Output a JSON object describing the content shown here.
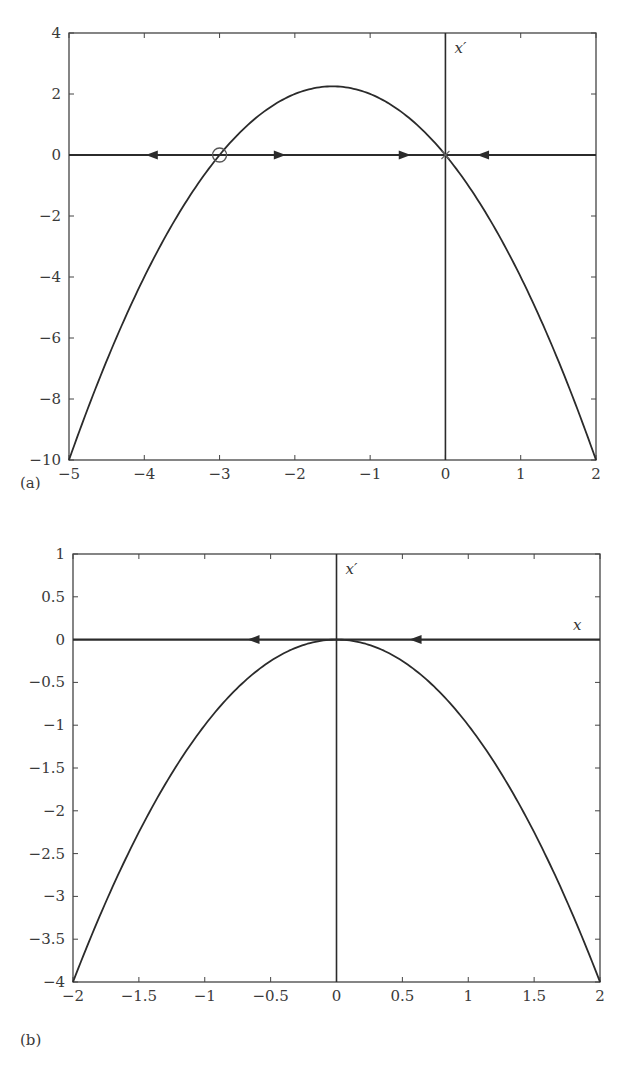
{
  "chart_data": [
    {
      "panel": "(a)",
      "type": "line",
      "title": "",
      "xlabel": "x",
      "ylabel": "x'",
      "equation": "x' = -x^2 - 3x",
      "xlim": [
        -5,
        2
      ],
      "ylim": [
        -10,
        4
      ],
      "xticks": [
        -5,
        -4,
        -3,
        -2,
        -1,
        0,
        1,
        2
      ],
      "yticks": [
        -10,
        -8,
        -6,
        -4,
        -2,
        0,
        2,
        4
      ],
      "xtick_labels": [
        "−5",
        "−4",
        "−3",
        "−2",
        "−1",
        "0",
        "1",
        "2"
      ],
      "ytick_labels": [
        "−10",
        "−8",
        "−6",
        "−4",
        "−2",
        "0",
        "2",
        "4"
      ],
      "grid": false,
      "series": [
        {
          "name": "x'(x)",
          "x": [
            -5,
            -4.5,
            -4,
            -3.5,
            -3,
            -2.5,
            -2,
            -1.5,
            -1,
            -0.5,
            0,
            0.5,
            1,
            1.5,
            2
          ],
          "y": [
            -10,
            -6.75,
            -4,
            -1.75,
            0,
            1.25,
            2,
            2.25,
            2,
            1.25,
            0,
            -1.75,
            -4,
            -6.75,
            -10
          ]
        }
      ],
      "fixed_points": [
        {
          "x": -3,
          "y": 0,
          "marker": "open-circle",
          "stability": "unstable"
        },
        {
          "x": 0,
          "y": 0,
          "marker": "cross",
          "stability": "stable"
        }
      ],
      "flow_arrows": [
        {
          "x": -3.9,
          "direction": "left"
        },
        {
          "x": -2.2,
          "direction": "right"
        },
        {
          "x": -0.54,
          "direction": "right"
        },
        {
          "x": 0.5,
          "direction": "left"
        }
      ],
      "axis_annotation": "x′"
    },
    {
      "panel": "(b)",
      "type": "line",
      "title": "",
      "xlabel": "x",
      "ylabel": "x'",
      "equation": "x' = -x^2",
      "xlim": [
        -2,
        2
      ],
      "ylim": [
        -4,
        1
      ],
      "xticks": [
        -2,
        -1.5,
        -1,
        -0.5,
        0,
        0.5,
        1,
        1.5,
        2
      ],
      "yticks": [
        -4,
        -3.5,
        -3,
        -2.5,
        -2,
        -1.5,
        -1,
        -0.5,
        0,
        0.5,
        1
      ],
      "xtick_labels": [
        "−2",
        "−1.5",
        "−1",
        "−0.5",
        "0",
        "0.5",
        "1",
        "1.5",
        "2"
      ],
      "ytick_labels": [
        "−4",
        "−3.5",
        "−3",
        "−2.5",
        "−2",
        "−1.5",
        "−1",
        "−0.5",
        "0",
        "0.5",
        "1"
      ],
      "grid": false,
      "series": [
        {
          "name": "x'(x)",
          "x": [
            -2,
            -1.5,
            -1,
            -0.5,
            0,
            0.5,
            1,
            1.5,
            2
          ],
          "y": [
            -4,
            -2.25,
            -1,
            -0.25,
            0,
            -0.25,
            -1,
            -2.25,
            -4
          ]
        }
      ],
      "fixed_points": [
        {
          "x": 0,
          "y": 0,
          "marker": "none",
          "stability": "semi-stable"
        }
      ],
      "flow_arrows": [
        {
          "x": -0.63,
          "direction": "left"
        },
        {
          "x": 0.6,
          "direction": "left"
        }
      ],
      "axis_annotation": "x′",
      "x_axis_annotation": "x"
    }
  ],
  "labels": {
    "panel_a": "(a)",
    "panel_b": "(b)",
    "xprime_a": "x′",
    "xprime_b": "x′",
    "x_b": "x"
  }
}
